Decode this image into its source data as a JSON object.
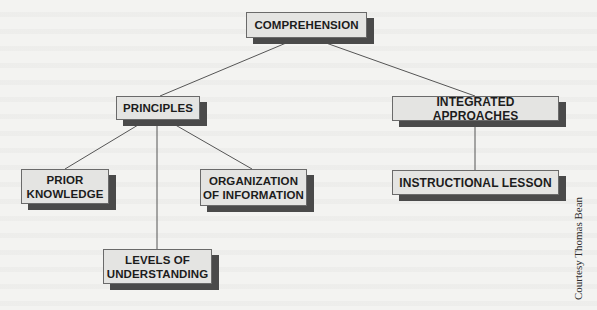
{
  "diagram": {
    "type": "hierarchy",
    "root": {
      "id": "comprehension",
      "label": "COMPREHENSION"
    },
    "nodes": [
      {
        "id": "comprehension",
        "label": "COMPREHENSION"
      },
      {
        "id": "principles",
        "label": "PRINCIPLES"
      },
      {
        "id": "integrated",
        "label": "INTEGRATED APPROACHES"
      },
      {
        "id": "prior",
        "label": "PRIOR\nKNOWLEDGE"
      },
      {
        "id": "organization",
        "label": "ORGANIZATION\nOF INFORMATION"
      },
      {
        "id": "levels",
        "label": "LEVELS OF\nUNDERSTANDING"
      },
      {
        "id": "lesson",
        "label": "INSTRUCTIONAL LESSON"
      }
    ],
    "edges": [
      {
        "from": "comprehension",
        "to": "principles"
      },
      {
        "from": "comprehension",
        "to": "integrated"
      },
      {
        "from": "principles",
        "to": "prior"
      },
      {
        "from": "principles",
        "to": "levels"
      },
      {
        "from": "principles",
        "to": "organization"
      },
      {
        "from": "integrated",
        "to": "lesson"
      }
    ],
    "colors": {
      "box_fill": "#e4e4e2",
      "box_shadow": "#4a4a4a",
      "line": "#555555",
      "background": "#f3f3f1"
    }
  },
  "labels": {
    "comprehension": "COMPREHENSION",
    "principles": "PRINCIPLES",
    "integrated": "INTEGRATED APPROACHES",
    "prior_line1": "PRIOR",
    "prior_line2": "KNOWLEDGE",
    "organization_line1": "ORGANIZATION",
    "organization_line2": "OF INFORMATION",
    "levels_line1": "LEVELS OF",
    "levels_line2": "UNDERSTANDING",
    "lesson": "INSTRUCTIONAL LESSON"
  },
  "credit": "Courtesy Thomas Bean"
}
